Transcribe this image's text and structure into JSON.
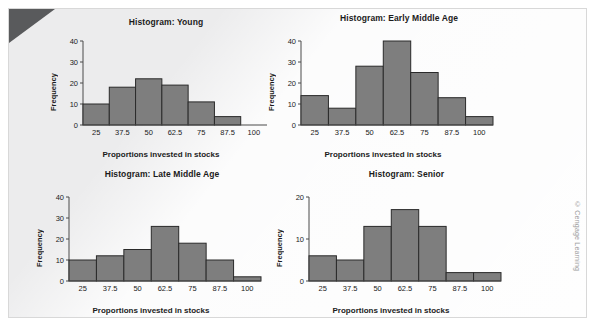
{
  "attribution": "© Cengage Learning",
  "common": {
    "xlabel": "Proportions invested in stocks",
    "ylabel": "Frequency",
    "categories": [
      "25",
      "37.5",
      "50",
      "62.5",
      "75",
      "87.5",
      "100"
    ]
  },
  "colors": {
    "panel_background": "#ececed",
    "bar_fill": "#7e7e7e",
    "bar_stroke": "#2a2a2a",
    "axis": "#4a4a4a",
    "text": "#1b1b1b",
    "corner_fold": "#595a5c",
    "attribution_text": "#9b9b9b"
  },
  "chart_data": [
    {
      "id": "young",
      "type": "bar",
      "title": "Histogram: Young",
      "xlabel": "Proportions invested in stocks",
      "ylabel": "Frequency",
      "categories": [
        "25",
        "37.5",
        "50",
        "62.5",
        "75",
        "87.5",
        "100"
      ],
      "values": [
        10,
        18,
        22,
        19,
        11,
        4
      ],
      "yticks": [
        0,
        10,
        20,
        30,
        40
      ],
      "ylim": [
        0,
        40
      ],
      "grid": false,
      "legend": "none"
    },
    {
      "id": "early-middle-age",
      "type": "bar",
      "title": "Histogram: Early Middle Age",
      "xlabel": "Proportions invested in stocks",
      "ylabel": "Frequency",
      "categories": [
        "25",
        "37.5",
        "50",
        "62.5",
        "75",
        "87.5",
        "100"
      ],
      "values": [
        14,
        8,
        28,
        40,
        25,
        13,
        4
      ],
      "yticks": [
        0,
        10,
        20,
        30,
        40
      ],
      "ylim": [
        0,
        40
      ],
      "grid": false,
      "legend": "none"
    },
    {
      "id": "late-middle-age",
      "type": "bar",
      "title": "Histogram: Late Middle Age",
      "xlabel": "Proportions invested in stocks",
      "ylabel": "Frequency",
      "categories": [
        "25",
        "37.5",
        "50",
        "62.5",
        "75",
        "87.5",
        "100"
      ],
      "values": [
        10,
        12,
        15,
        26,
        18,
        10,
        2
      ],
      "yticks": [
        0,
        10,
        20,
        30,
        40
      ],
      "ylim": [
        0,
        40
      ],
      "grid": false,
      "legend": "none"
    },
    {
      "id": "senior",
      "type": "bar",
      "title": "Histogram: Senior",
      "xlabel": "Proportions invested in stocks",
      "ylabel": "Frequency",
      "categories": [
        "25",
        "37.5",
        "50",
        "62.5",
        "75",
        "87.5",
        "100"
      ],
      "values": [
        6,
        5,
        13,
        17,
        13,
        2,
        2
      ],
      "yticks": [
        0,
        10,
        20
      ],
      "ylim": [
        0,
        20
      ],
      "grid": false,
      "legend": "none"
    }
  ]
}
